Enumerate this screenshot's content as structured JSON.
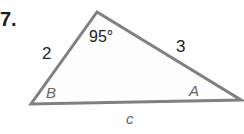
{
  "problem": {
    "number": "7."
  },
  "triangle": {
    "vertices": {
      "top": [
        97,
        12
      ],
      "B": [
        31,
        104
      ],
      "A": [
        241,
        100
      ]
    },
    "angle_top": "95°",
    "side_left": "2",
    "side_right": "3",
    "side_bottom": "c",
    "vertex_B": "B",
    "vertex_A": "A",
    "stroke_color": "#808080"
  }
}
